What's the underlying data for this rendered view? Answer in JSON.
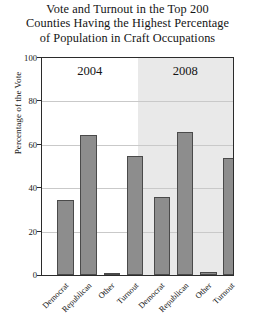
{
  "chart_data": {
    "type": "bar",
    "title": "Vote and Turnout in the Top 200 Counties Having the Highest Percentage of Population in Craft Occupations",
    "title_lines": [
      "Vote and Turnout in the Top 200",
      "Counties Having the Highest Percentage",
      "of Population in Craft Occupations"
    ],
    "xlabel": "",
    "ylabel": "Percentage of the Vote",
    "ylim": [
      0,
      100
    ],
    "yticks": [
      0,
      20,
      40,
      60,
      80,
      100
    ],
    "ytick_labels": [
      "0",
      "20",
      "40",
      "60",
      "80",
      "100"
    ],
    "grid": true,
    "legend": "none",
    "panels": [
      {
        "label": "2004",
        "background": "#ffffff",
        "categories": [
          "Democrat",
          "Republican",
          "Other",
          "Turnout"
        ],
        "values": [
          34.5,
          64.5,
          1,
          55
        ]
      },
      {
        "label": "2008",
        "background": "#e9e9e9",
        "categories": [
          "Democrat",
          "Republican",
          "Other",
          "Turnout"
        ],
        "values": [
          36,
          66,
          1.5,
          54
        ]
      }
    ],
    "categories": [
      "Democrat",
      "Republican",
      "Other",
      "Turnout",
      "Democrat",
      "Republican",
      "Other",
      "Turnout"
    ],
    "values": [
      34.5,
      64.5,
      1,
      55,
      36,
      66,
      1.5,
      54
    ],
    "colors": {
      "bar_fill": "#8d8d8d",
      "bar_edge": "#4a4a4a",
      "panel_2004_bg": "#ffffff",
      "panel_2008_bg": "#e9e9e9",
      "grid": "#c9c9c9",
      "axis": "#2b2b2b",
      "text": "#141414"
    }
  }
}
